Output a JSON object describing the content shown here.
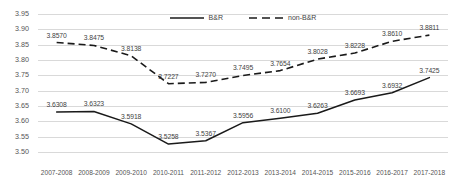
{
  "chart_data": {
    "type": "line",
    "title": "",
    "xlabel": "",
    "ylabel": "",
    "categories": [
      "2007-2008",
      "2008-2009",
      "2009-2010",
      "2010-2011",
      "2011-2012",
      "2012-2013",
      "2013-2014",
      "2014-2015",
      "2015-2016",
      "2016-2017",
      "2017-2018"
    ],
    "series": [
      {
        "name": "B&R",
        "style": "solid",
        "color": "#1a1a1a",
        "values": [
          3.6308,
          3.6323,
          3.5918,
          3.5258,
          3.5367,
          3.5956,
          3.61,
          3.6263,
          3.6693,
          3.6932,
          3.7425
        ],
        "labels": [
          "3.6308",
          "3.6323",
          "3.5918",
          "3.5258",
          "3.5367",
          "3.5956",
          "3.6100",
          "3.6263",
          "3.6693",
          "3.6932",
          "3.7425"
        ]
      },
      {
        "name": "non-B&R",
        "style": "dashed",
        "color": "#1a1a1a",
        "values": [
          3.857,
          3.8475,
          3.8138,
          3.7227,
          3.727,
          3.7495,
          3.7654,
          3.8028,
          3.8228,
          3.861,
          3.8811
        ],
        "labels": [
          "3.8570",
          "3.8475",
          "3.8138",
          "3.7227",
          "3.7270",
          "3.7495",
          "3.7654",
          "3.8028",
          "3.8228",
          "3.8610",
          "3.8811"
        ]
      }
    ],
    "ylim": [
      3.5,
      3.95
    ],
    "ystep": 0.05,
    "yticks": [
      "3.95",
      "3.90",
      "3.85",
      "3.80",
      "3.75",
      "3.70",
      "3.65",
      "3.60",
      "3.55",
      "3.50"
    ],
    "grid": "horizontal",
    "legend_position": "top-center",
    "legend": [
      {
        "label": "B&R",
        "style": "solid"
      },
      {
        "label": "non-B&R",
        "style": "dashed"
      }
    ]
  }
}
